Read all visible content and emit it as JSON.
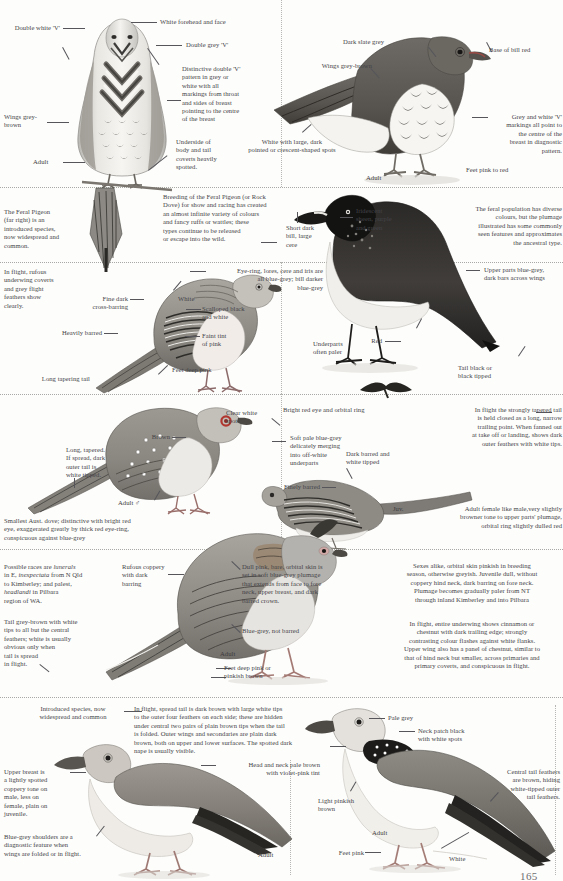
{
  "page": {
    "number": "165",
    "width": 563,
    "height": 881
  },
  "panels": [
    {
      "id": "topknot-pigeon",
      "captions": [
        {
          "name": "white-forehead-and-face",
          "text": "White forehead and face"
        },
        {
          "name": "double-grey-v",
          "text": "Double grey 'V'"
        },
        {
          "name": "double-white-v",
          "text": "Double white 'V'"
        },
        {
          "name": "wings-grey-brown-left",
          "text": "Wings grey-\nbrown"
        },
        {
          "name": "distinctive-double-v-pattern",
          "text": "Distinctive double 'V'\npattern in grey or\nwhite with all\nmarkings from throat\nand sides of breast\npointing to the centre\nof the breast"
        },
        {
          "name": "underside-heavily-spotted",
          "text": "Underside of\nbody and tail\ncoverts heavily\nspotted."
        },
        {
          "name": "adult-front",
          "text": "Adult"
        },
        {
          "name": "dark-slate-grey",
          "text": "Dark slate grey"
        },
        {
          "name": "wings-grey-brown-right",
          "text": "Wings grey-brown"
        },
        {
          "name": "base-of-bill-red",
          "text": "Base of bill red"
        },
        {
          "name": "grey-and-white-v-markings",
          "text": "Grey and white 'V'\nmarkings all point to\nthe centre of the\nbreast in diagnostic\npattern."
        },
        {
          "name": "white-with-crescent-spots",
          "text": "White with large, dark\npointed or crescent-shaped spots"
        },
        {
          "name": "feet-pink-to-red",
          "text": "Feet pink to red"
        },
        {
          "name": "adult-side",
          "text": "Adult"
        }
      ]
    },
    {
      "id": "feral-pigeon",
      "captions": [
        {
          "name": "feral-pigeon-introduced",
          "text": "The Feral Pigeon\n(far right) is an\nintroduced species,\nnow widespread and\ncommon."
        },
        {
          "name": "breeding-of-feral-pigeon",
          "text": "Breeding of the Feral Pigeon (or Rock\nDove) for show and racing has created\nan almost infinite variety of colours\nand fancy ruffs or wattles; these\ntypes continue to be released\nor escape into the wild."
        },
        {
          "name": "short-dark-bill-large-cere",
          "text": "Short dark\nbill, large\ncere"
        },
        {
          "name": "iridescent-sheen",
          "text": "Iridescent\nsheen, purple\nand green"
        },
        {
          "name": "feral-population-diverse",
          "text": "The feral population has diverse\ncolours, but the plumage\nillustrated has some commonly\nseen features and approximates\nthe ancestral type."
        },
        {
          "name": "upper-parts-blue-grey",
          "text": "Upper parts blue-grey,\ndark bars across wings"
        },
        {
          "name": "underparts-often-paler",
          "text": "Underparts\noften paler"
        },
        {
          "name": "red-feet",
          "text": "Red"
        },
        {
          "name": "tail-black-or-black-tipped",
          "text": "Tail black or\nblack tipped"
        }
      ]
    },
    {
      "id": "bar-shouldered-dove",
      "captions": [
        {
          "name": "in-flight-rufous-underwing",
          "text": "In flight, rufous\nunderwing coverts\nand grey flight\nfeathers show\nclearly."
        },
        {
          "name": "fine-dark-cross-barring",
          "text": "Fine dark\ncross-barring"
        },
        {
          "name": "heavily-barred",
          "text": "Heavily barred"
        },
        {
          "name": "long-tapering-tail",
          "text": "Long tapering tail"
        },
        {
          "name": "eye-ring-lores-cere-iris",
          "text": "Eye-ring, lores, cere and iris are\nall blue-grey; bill darker\nblue-grey"
        },
        {
          "name": "white-throat",
          "text": "White"
        },
        {
          "name": "scalloped-black-and-white",
          "text": "Scalloped black\nand white"
        },
        {
          "name": "faint-tint-of-pink",
          "text": "Faint tint\nof pink"
        },
        {
          "name": "feet-deep-pink",
          "text": "Feet deep pink"
        }
      ]
    },
    {
      "id": "diamond-dove",
      "captions": [
        {
          "name": "clear-white-spots",
          "text": "Clear white\nspots"
        },
        {
          "name": "brown",
          "text": "Brown"
        },
        {
          "name": "long-tapered-tail",
          "text": "Long, tapered.\nIf spread, dark\nouter tail is\nwhite tipped."
        },
        {
          "name": "adult-male",
          "text": "Adult ♂"
        },
        {
          "name": "smallest-aust-dove",
          "text": "Smallest Aust. dove; distinctive with bright red\neye, exaggerated greatly by thick red eye-ring,\nconspicuous against blue-grey"
        },
        {
          "name": "bright-red-eye-orbital-ring",
          "text": "Bright red eye and orbital ring"
        },
        {
          "name": "soft-pale-blue-grey",
          "text": "Soft pale blue-grey\ndelicately merging\ninto off-white\nunderparts"
        },
        {
          "name": "finely-barred",
          "text": "Finely barred"
        },
        {
          "name": "dark-barred-white-tipped",
          "text": "Dark barred and\nwhite tipped"
        },
        {
          "name": "juv",
          "text": "Juv."
        },
        {
          "name": "in-flight-tapered-tail",
          "text": "In flight the strongly tapered tail\nis held closed as a long, narrow\ntrailing point.  When fanned out\nat take off or landing, shows dark\nouter feathers with white tips."
        },
        {
          "name": "adult-female-like-male",
          "text": "Adult female like male,very slightly\nbrowner tone to upper parts' plumage,\norbital ring slightly dulled red"
        }
      ]
    },
    {
      "id": "crested-pigeon-races",
      "captions": [
        {
          "name": "possible-races",
          "text": "Possible races are <i>lunerals</i>\nin E, <i>inexpectata</i> from N Qld\nto Kimberley; and palest,\n<i>headlandi</i> in Pilbara\nregion of WA."
        },
        {
          "name": "tail-grey-brown-white-tips",
          "text": "Tail grey-brown with white\ntips to all but the central\nfeathers; white is usually\nobvious only when\ntail is spread\nin flight."
        },
        {
          "name": "rufous-coppery-with-dark-barring",
          "text": "Rufous coppery\nwith dark\nbarring"
        },
        {
          "name": "dull-pink-bare-orbital-skin",
          "text": "Dull pink, bare, orbital skin is\nset in soft blue-grey plumage\nthat extends from face to fore\nneck, upper breast, and dark\nbarred crown."
        },
        {
          "name": "blue-grey-not-barred",
          "text": "Blue-grey, not barred"
        },
        {
          "name": "adult-crested",
          "text": "Adult"
        },
        {
          "name": "feet-deep-pink-or-pinkish-brown",
          "text": "Feet deep pink or\npinkish brown"
        },
        {
          "name": "sexes-alike-orbital-skin",
          "text": "Sexes alike, orbital skin pinkish in breeding\nseason, otherwise greyish.  Juvenile dull, without\ncoppery hind neck, dark barring on fore neck.\nPlumage becomes gradually paler from NT\nthrough inland Kimberley and into Pilbara"
        },
        {
          "name": "in-flight-underwing-cinnamon",
          "text": "In flight, entire underwing shows cinnamon or\nchestnut with dark trailing edge; strongly\ncontrasting colour flashes against white flanks.\nUpper wing also has a panel of chestnut, similar to\nthat of hind neck but smaller, across primaries and\nprimary coverts, and conspicuous in flight."
        }
      ]
    },
    {
      "id": "spotted-turtle-dove",
      "captions": [
        {
          "name": "introduced-species",
          "text": "Introduced species, now\nwidespread and common"
        },
        {
          "name": "in-flight-spread-tail",
          "text": "In flight, spread tail is dark brown with large white tips\nto the outer four feathers on each side; these are hidden\nunder central two pairs of plain brown tips when the tail\nis folded.  Outer wings and secondaries are plain dark\nbrown, both on upper and lower surfaces.  The spotted dark\nnape is usually visible."
        },
        {
          "name": "upper-breast-lightly-spotted",
          "text": "Upper breast is\na lightly spotted\ncoppery tone on\nmale, less on\nfemale, plain on\njuvenile."
        },
        {
          "name": "blue-grey-shoulders",
          "text": "Blue-grey shoulders are a\ndiagnostic feature when\nwings are folded or in flight."
        },
        {
          "name": "head-and-neck-pale-brown",
          "text": "Head and neck pale brown\nwith violet-pink tint"
        },
        {
          "name": "adult-turtle-left",
          "text": "Adult"
        },
        {
          "name": "pale-grey",
          "text": "Pale grey"
        },
        {
          "name": "neck-patch-black-white-spots",
          "text": "Neck patch black\nwith white spots"
        },
        {
          "name": "central-tail-leathers",
          "text": "Central tail feathers\nare brown, hiding\nwhite-tipped outer\ntail feathers."
        },
        {
          "name": "light-pinkish-brown",
          "text": "Light pinkish\nbrown"
        },
        {
          "name": "adult-turtle-right",
          "text": "Adult"
        },
        {
          "name": "feet-pink",
          "text": "Feet pink"
        },
        {
          "name": "white-undertail",
          "text": "White"
        }
      ]
    }
  ],
  "colors": {
    "text": "#434347",
    "rule": "#9a9a96",
    "leader": "#55555a",
    "page_bg": "#fdfdfb"
  }
}
